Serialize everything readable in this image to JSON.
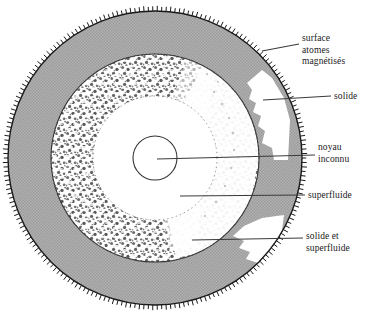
{
  "figure": {
    "background_color": "#ffffff",
    "line_color": "#1a1a1a",
    "gray_fill": "#a8a8a8",
    "stipple_color": "#4a4a4a",
    "center": {
      "x": 155,
      "y": 158
    },
    "layers": [
      {
        "name": "surface-atomes-magnetises",
        "label": "surface\natomes\nmagnétisés",
        "radius_outer": 147,
        "radius_inner": 147,
        "fill": "none",
        "description": "outer rim with radial tick hatching"
      },
      {
        "name": "solide",
        "label": "solide",
        "radius_outer": 147,
        "radius_inner": 104,
        "fill": "#a8a8a8",
        "description": "gray annulus"
      },
      {
        "name": "solide-et-superfluide",
        "label": "solide et\nsuperfluide",
        "radius_outer": 104,
        "radius_inner": 62,
        "fill": "stipple",
        "description": "mottled stippled annulus"
      },
      {
        "name": "superfluide",
        "label": "superfluide",
        "radius_outer": 62,
        "radius_inner": 22,
        "fill": "#ffffff",
        "description": "white inner region"
      },
      {
        "name": "noyau-inconnu",
        "label": "noyau\ninconnu",
        "radius_outer": 22,
        "radius_inner": 0,
        "fill": "#ffffff",
        "description": "small outlined core circle"
      }
    ],
    "labels": {
      "surface": "surface\natomes\nmagnétisés",
      "solide": "solide",
      "noyau": "noyau\ninconnu",
      "superfluide": "superfluide",
      "solide_et_superfluide": "solide et\nsuperfluide"
    },
    "leaders": [
      {
        "name": "leader-surface",
        "x1": 262,
        "y1": 51,
        "x2": 299,
        "y2": 44
      },
      {
        "name": "leader-solide",
        "x1": 263,
        "y1": 100,
        "x2": 331,
        "y2": 96
      },
      {
        "name": "leader-noyau",
        "x1": 159,
        "y1": 160,
        "x2": 315,
        "y2": 155
      },
      {
        "name": "leader-superfluide",
        "x1": 180,
        "y1": 196,
        "x2": 305,
        "y2": 195
      },
      {
        "name": "leader-solide-superfluide",
        "x1": 192,
        "y1": 240,
        "x2": 303,
        "y2": 238
      }
    ]
  }
}
